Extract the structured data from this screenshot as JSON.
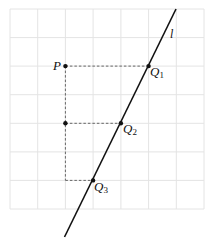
{
  "diagram": {
    "type": "geometry-grid",
    "grid": {
      "columns": 7,
      "rows": 7,
      "x_lines": [
        10,
        37.7,
        65.4,
        93.1,
        120.9,
        148.6,
        176.3,
        204
      ],
      "y_lines": [
        9,
        37.6,
        66.1,
        94.7,
        123.3,
        151.9,
        180.4,
        209
      ],
      "color": "#e4e4e4"
    },
    "line_l": {
      "label": "l",
      "from": [
        176,
        9
      ],
      "to": [
        64.5,
        237
      ],
      "color": "#111111"
    },
    "points": [
      {
        "name": "P",
        "label": "P",
        "sub": "",
        "x": 65.4,
        "y": 66.1
      },
      {
        "name": "Q1",
        "label": "Q",
        "sub": "1",
        "x": 148.6,
        "y": 66.1
      },
      {
        "name": "Q2",
        "label": "Q",
        "sub": "2",
        "x": 120.9,
        "y": 123.3
      },
      {
        "name": "Q3",
        "label": "Q",
        "sub": "3",
        "x": 93.1,
        "y": 180.4
      },
      {
        "name": "M",
        "label": "",
        "sub": "",
        "x": 65.4,
        "y": 123.3
      }
    ],
    "dashed_segments": [
      {
        "from": [
          65.4,
          66.1
        ],
        "to": [
          148.6,
          66.1
        ]
      },
      {
        "from": [
          65.4,
          123.3
        ],
        "to": [
          120.9,
          123.3
        ]
      },
      {
        "from": [
          65.4,
          180.4
        ],
        "to": [
          93.1,
          180.4
        ]
      },
      {
        "from": [
          65.4,
          66.1
        ],
        "to": [
          65.4,
          180.4
        ]
      }
    ],
    "labels": {
      "P": "P",
      "Q1": "Q",
      "Q1_sub": "1",
      "Q2": "Q",
      "Q2_sub": "2",
      "Q3": "Q",
      "Q3_sub": "3",
      "l": "l"
    }
  }
}
